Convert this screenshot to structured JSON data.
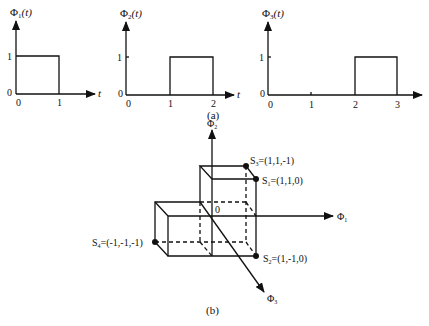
{
  "figure": {
    "part_a": {
      "caption": "(a)",
      "plots": [
        {
          "ylabel": "Φ",
          "ysub": "1",
          "yarg": "(t)",
          "y_ticks": [
            "0",
            "1"
          ],
          "x_ticks": [
            "0",
            "1"
          ],
          "xlabel": "t",
          "pulse": [
            0,
            1
          ]
        },
        {
          "ylabel": "Φ",
          "ysub": "2",
          "yarg": "(t)",
          "y_ticks": [
            "0",
            "1"
          ],
          "x_ticks": [
            "0",
            "1",
            "2"
          ],
          "xlabel": "t",
          "pulse": [
            1,
            2
          ]
        },
        {
          "ylabel": "Φ",
          "ysub": "3",
          "yarg": "(t)",
          "y_ticks": [
            "0",
            "1"
          ],
          "x_ticks": [
            "0",
            "1",
            "2",
            "3"
          ],
          "xlabel": "t",
          "pulse": [
            2,
            3
          ]
        }
      ]
    },
    "part_b": {
      "caption": "(b)",
      "origin_label": "0",
      "axes": [
        {
          "name": "Φ",
          "sub": "1"
        },
        {
          "name": "Φ",
          "sub": "2"
        },
        {
          "name": "Φ",
          "sub": "3"
        }
      ],
      "points": [
        {
          "name": "S",
          "sub": "3",
          "coords": "=(1,1,-1)"
        },
        {
          "name": "S",
          "sub": "1",
          "coords": "=(1,1,0)"
        },
        {
          "name": "S",
          "sub": "4",
          "coords": "=(-1,-1,-1)"
        },
        {
          "name": "S",
          "sub": "2",
          "coords": "=(1,-1,0)"
        }
      ]
    }
  }
}
